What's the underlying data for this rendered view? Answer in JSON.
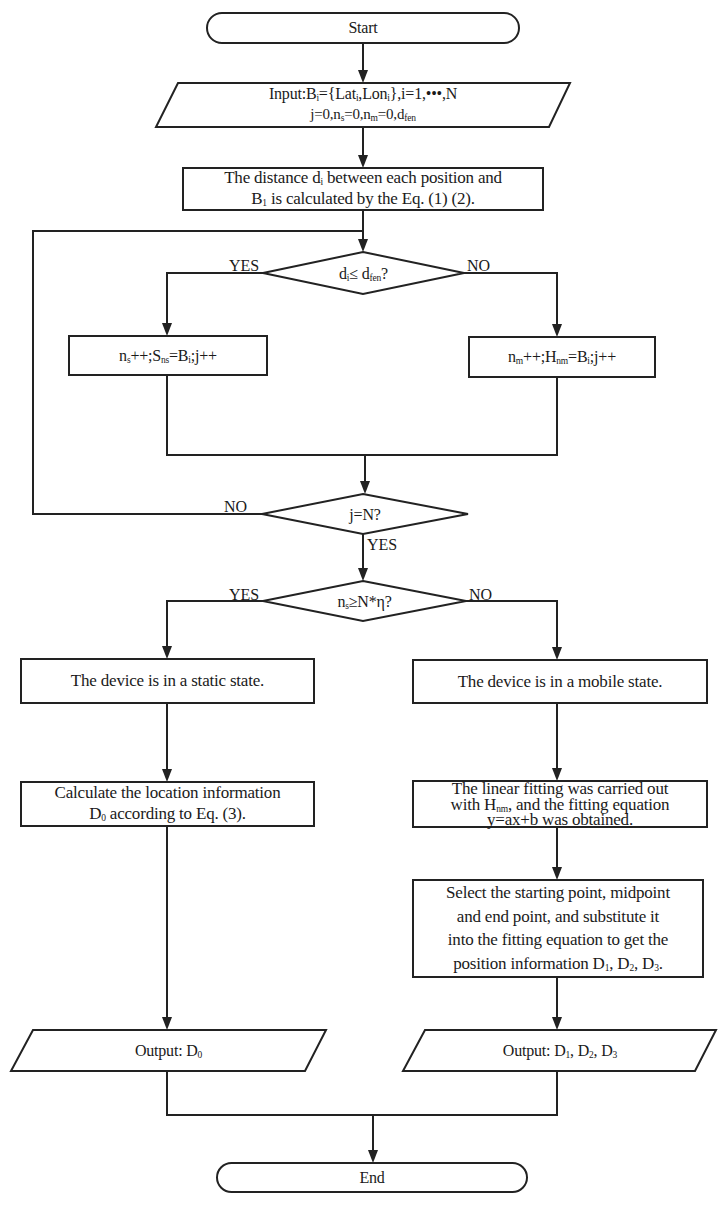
{
  "diagram": {
    "type": "flowchart",
    "nodes": {
      "start": {
        "shape": "terminator",
        "label": "Start"
      },
      "input": {
        "shape": "parallelogram",
        "line1_prefix": "Input:B",
        "line1_sub_i": "i",
        "line1_mid": "={Lat",
        "line1_sub_i2": "i",
        "line1_mid2": ",Lon",
        "line1_sub_i3": "i",
        "line1_suffix": "},i=1,•••,N",
        "line2_a": "j=0,n",
        "line2_sub_s": "s",
        "line2_b": "=0,n",
        "line2_sub_m": "m",
        "line2_c": "=0,d",
        "line2_sub_fen": "fen",
        "full_text": "Input:Bi={Lati,Loni},i=1,•••,N j=0,ns=0,nm=0,dfen"
      },
      "distance": {
        "shape": "process",
        "line1_a": "The distance d",
        "line1_sub": "i",
        "line1_b": " between each position and",
        "line2_a": "B",
        "line2_sub": "1",
        "line2_b": " is calculated by the Eq. (1) (2).",
        "full_text": "The distance di between each position and B1 is calculated by the Eq. (1) (2)."
      },
      "decision1": {
        "shape": "decision",
        "a": "d",
        "sub_i": "i",
        "b": "≤ d",
        "sub_fen": "fen",
        "c": "?",
        "full_text": "di≤ dfen?",
        "yes_label": "YES",
        "no_label": "NO"
      },
      "static_count": {
        "shape": "process",
        "a": "n",
        "sub_s": "s",
        "b": "++;S",
        "sub_ns": "ns",
        "c": "=B",
        "sub_i": "i",
        "d": ";j++",
        "full_text": "ns++;Sns=Bi;j++"
      },
      "mobile_count": {
        "shape": "process",
        "a": "n",
        "sub_m": "m",
        "b": "++;H",
        "sub_nm": "nm",
        "c": "=B",
        "sub_i": "i",
        "d": ";j++",
        "full_text": "nm++;Hnm=Bi;j++"
      },
      "decision2": {
        "shape": "decision",
        "label": "j=N?",
        "yes_label": "YES",
        "no_label": "NO"
      },
      "decision3": {
        "shape": "decision",
        "a": "n",
        "sub_s": "s",
        "b": "≥N*η?",
        "full_text": "ns≥N*η?",
        "yes_label": "YES",
        "no_label": "NO"
      },
      "static_state": {
        "shape": "process",
        "label": "The device is in a static state."
      },
      "mobile_state": {
        "shape": "process",
        "label": "The device is in a mobile state."
      },
      "calc_location": {
        "shape": "process",
        "line1": "Calculate the location information",
        "line2_a": "D",
        "line2_sub": "0",
        "line2_b": " according to Eq. (3).",
        "full_text": "Calculate the location information D0 according to Eq. (3)."
      },
      "linear_fit": {
        "shape": "process",
        "line1": "The linear fitting was carried out",
        "line2_a": "with H",
        "line2_sub": "nm",
        "line2_b": ", and the fitting equation",
        "line3": "y=ax+b was obtained.",
        "full_text": "The linear fitting was carried out with Hnm, and the fitting equation y=ax+b was obtained."
      },
      "select_points": {
        "shape": "process",
        "line1": "Select the starting point, midpoint",
        "line2": "and end point, and substitute it",
        "line3": "into the fitting equation to get the",
        "line4_a": "position information D",
        "line4_s1": "1",
        "line4_b": ", D",
        "line4_s2": "2",
        "line4_c": ", D",
        "line4_s3": "3",
        "line4_d": ".",
        "full_text": "Select the starting point, midpoint and end point, and substitute it into the fitting equation to get the position information D1, D2, D3."
      },
      "output_static": {
        "shape": "parallelogram",
        "a": "Output: D",
        "sub": "0",
        "full_text": "Output: D0"
      },
      "output_mobile": {
        "shape": "parallelogram",
        "a": "Output: D",
        "s1": "1",
        "b": ", D",
        "s2": "2",
        "c": ", D",
        "s3": "3",
        "full_text": "Output: D1, D2, D3"
      },
      "end": {
        "shape": "terminator",
        "label": "End"
      }
    },
    "edges": [
      {
        "from": "start",
        "to": "input"
      },
      {
        "from": "input",
        "to": "distance"
      },
      {
        "from": "distance",
        "to": "decision1"
      },
      {
        "from": "decision1",
        "to": "static_count",
        "label": "YES"
      },
      {
        "from": "decision1",
        "to": "mobile_count",
        "label": "NO"
      },
      {
        "from": "static_count",
        "to": "decision2"
      },
      {
        "from": "mobile_count",
        "to": "decision2"
      },
      {
        "from": "decision2",
        "to": "decision1",
        "label": "NO"
      },
      {
        "from": "decision2",
        "to": "decision3",
        "label": "YES"
      },
      {
        "from": "decision3",
        "to": "static_state",
        "label": "YES"
      },
      {
        "from": "decision3",
        "to": "mobile_state",
        "label": "NO"
      },
      {
        "from": "static_state",
        "to": "calc_location"
      },
      {
        "from": "calc_location",
        "to": "output_static"
      },
      {
        "from": "mobile_state",
        "to": "linear_fit"
      },
      {
        "from": "linear_fit",
        "to": "select_points"
      },
      {
        "from": "select_points",
        "to": "output_mobile"
      },
      {
        "from": "output_static",
        "to": "end"
      },
      {
        "from": "output_mobile",
        "to": "end"
      }
    ],
    "colors": {
      "stroke": "#222222",
      "background": "#ffffff",
      "text": "#1a1a1a"
    }
  }
}
